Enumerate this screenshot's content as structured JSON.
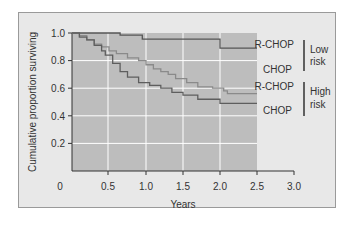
{
  "chart_data": {
    "type": "line",
    "subtype": "kaplan-meier step",
    "title": "",
    "xlabel": "Years",
    "ylabel": "Cumulative proportion surviving",
    "xlim": [
      0,
      3.0
    ],
    "ylim": [
      0,
      1.0
    ],
    "x_ticks": [
      "0",
      "0.5",
      "1.0",
      "1.5",
      "2.0",
      "2.5",
      "3.0"
    ],
    "y_ticks": [
      "0.2",
      "0.4",
      "0.6",
      "0.8",
      "1.0"
    ],
    "grid": true,
    "series": [
      {
        "name": "R-CHOP (Low risk)",
        "color": "#555555",
        "points": [
          [
            0,
            1.0
          ],
          [
            0.65,
            1.0
          ],
          [
            0.65,
            0.985
          ],
          [
            0.95,
            0.985
          ],
          [
            0.95,
            0.955
          ],
          [
            2.0,
            0.955
          ],
          [
            2.0,
            0.89
          ],
          [
            2.5,
            0.89
          ]
        ]
      },
      {
        "name": "R-CHOP (High risk)",
        "color": "#8a8a8a",
        "points": [
          [
            0,
            1.0
          ],
          [
            0.1,
            0.98
          ],
          [
            0.2,
            0.95
          ],
          [
            0.3,
            0.92
          ],
          [
            0.4,
            0.9
          ],
          [
            0.5,
            0.87
          ],
          [
            0.6,
            0.85
          ],
          [
            0.75,
            0.82
          ],
          [
            0.9,
            0.8
          ],
          [
            1.0,
            0.77
          ],
          [
            1.1,
            0.74
          ],
          [
            1.2,
            0.72
          ],
          [
            1.3,
            0.7
          ],
          [
            1.4,
            0.67
          ],
          [
            1.55,
            0.64
          ],
          [
            1.7,
            0.61
          ],
          [
            1.9,
            0.6
          ],
          [
            2.05,
            0.58
          ],
          [
            2.1,
            0.56
          ],
          [
            2.5,
            0.56
          ]
        ]
      },
      {
        "name": "CHOP (High risk)",
        "color": "#5e5e5e",
        "points": [
          [
            0,
            1.0
          ],
          [
            0.1,
            0.97
          ],
          [
            0.2,
            0.95
          ],
          [
            0.3,
            0.91
          ],
          [
            0.4,
            0.87
          ],
          [
            0.45,
            0.84
          ],
          [
            0.55,
            0.78
          ],
          [
            0.65,
            0.72
          ],
          [
            0.75,
            0.68
          ],
          [
            0.9,
            0.64
          ],
          [
            1.05,
            0.62
          ],
          [
            1.2,
            0.6
          ],
          [
            1.35,
            0.57
          ],
          [
            1.5,
            0.55
          ],
          [
            1.7,
            0.52
          ],
          [
            1.8,
            0.52
          ],
          [
            2.0,
            0.49
          ],
          [
            2.5,
            0.49
          ]
        ]
      }
    ],
    "annotations": [
      {
        "text": "R-CHOP",
        "y": 0.95
      },
      {
        "text": "CHOP",
        "y": 0.76
      },
      {
        "text": "R-CHOP",
        "y": 0.6
      },
      {
        "text": "CHOP",
        "y": 0.45
      }
    ],
    "groups": [
      {
        "label_line1": "Low",
        "label_line2": "risk"
      },
      {
        "label_line1": "High",
        "label_line2": "risk"
      }
    ]
  },
  "axes": {
    "xlabel": "Years",
    "ylabel": "Cumulative proportion surviving",
    "x_ticks": [
      "0",
      "0.5",
      "1.0",
      "1.5",
      "2.0",
      "2.5",
      "3.0"
    ],
    "y_ticks": [
      "0.2",
      "0.4",
      "0.6",
      "0.8",
      "1.0"
    ]
  },
  "labels": {
    "low_rchop": "R-CHOP",
    "low_chop": "CHOP",
    "high_rchop": "R-CHOP",
    "high_chop": "CHOP",
    "low_1": "Low",
    "low_2": "risk",
    "high_1": "High",
    "high_2": "risk"
  }
}
